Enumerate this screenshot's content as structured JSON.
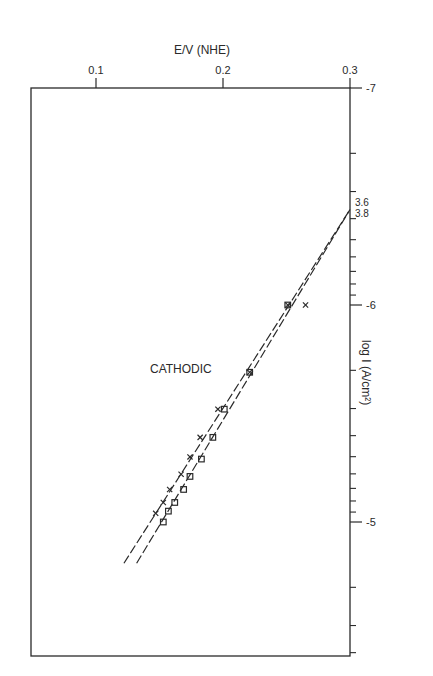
{
  "chart_data": {
    "type": "scatter",
    "title": "",
    "xlabel": "E/V (NHE)",
    "ylabel": "log I (A/cm²)",
    "x_axis": {
      "position": "top",
      "range": [
        0.05,
        0.3
      ],
      "ticks": [
        0.1,
        0.2,
        0.3
      ],
      "tick_labels": [
        "0.1",
        "0.2",
        "0.3"
      ]
    },
    "y_axis": {
      "position": "right",
      "scale": "log",
      "range": [
        -7,
        -4.4
      ],
      "ticks": [
        -7,
        -6,
        -5
      ],
      "tick_labels": [
        "-7",
        "-6",
        "-5"
      ],
      "direction": "down"
    },
    "grid": false,
    "annotations": [
      {
        "text": "CATHODIC",
        "x": 0.145,
        "y": -5.75
      },
      {
        "text": "3.6",
        "x": 0.3,
        "y": -6.47
      },
      {
        "text": "3.8",
        "x": 0.3,
        "y": -6.42
      }
    ],
    "series": [
      {
        "name": "x-markers",
        "marker": "x",
        "x": [
          0.265,
          0.251,
          0.221,
          0.196,
          0.182,
          0.174,
          0.167,
          0.158,
          0.153,
          0.147
        ],
        "y": [
          -6.0,
          -6.0,
          -5.69,
          -5.52,
          -5.39,
          -5.3,
          -5.22,
          -5.15,
          -5.09,
          -5.04
        ]
      },
      {
        "name": "square-markers",
        "marker": "square",
        "x": [
          0.251,
          0.221,
          0.201,
          0.192,
          0.183,
          0.174,
          0.169,
          0.162,
          0.157,
          0.153
        ],
        "y": [
          -6.0,
          -5.69,
          -5.52,
          -5.39,
          -5.29,
          -5.21,
          -5.15,
          -5.09,
          -5.05,
          -5.0
        ]
      }
    ],
    "fit_lines": [
      {
        "name": "fit-x",
        "style": "dashed",
        "x": [
          0.122,
          0.3
        ],
        "y": [
          -4.81,
          -6.44
        ],
        "label": "3.6"
      },
      {
        "name": "fit-square",
        "style": "dashed",
        "x": [
          0.132,
          0.3
        ],
        "y": [
          -4.81,
          -6.44
        ],
        "label": "3.8"
      }
    ]
  },
  "labels": {
    "xtitle": "E/V (NHE)",
    "ytitle": "log I (A/cm²)",
    "annotation": "CATHODIC",
    "line_label_1": "3.6",
    "line_label_2": "3.8",
    "x_ticks": [
      "0.1",
      "0.2",
      "0.3"
    ],
    "y_ticks": [
      "-7",
      "-6",
      "-5"
    ]
  }
}
